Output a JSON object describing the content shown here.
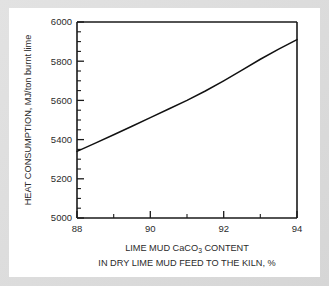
{
  "figure": {
    "background_color": "#ffffff",
    "frame_color": "#d9d9d9",
    "axis_color": "#1a1a1a",
    "curve_color": "#111111"
  },
  "chart_data": {
    "type": "line",
    "title": "",
    "xlabel_line1": "LIME MUD CaCO",
    "xlabel_line1_sub": "3",
    "xlabel_line1_tail": " CONTENT",
    "xlabel_line2": "IN DRY LIME MUD FEED TO THE KILN, %",
    "ylabel": "HEAT CONSUMPTION, MJ/ton burnt lime",
    "xlim": [
      88,
      94
    ],
    "ylim": [
      5000,
      6000
    ],
    "x_major_ticks": [
      88,
      90,
      92,
      94
    ],
    "x_major_tick_labels": [
      "88",
      "90",
      "92",
      "94"
    ],
    "x_minor_ticks": [
      89,
      91,
      93
    ],
    "y_major_ticks": [
      5000,
      5200,
      5400,
      5600,
      5800,
      6000
    ],
    "y_major_tick_labels": [
      "5000",
      "5200",
      "5400",
      "5600",
      "5800",
      "6000"
    ],
    "y_minor_ticks": [
      5050,
      5100,
      5150,
      5250,
      5300,
      5350,
      5450,
      5500,
      5550,
      5650,
      5700,
      5750,
      5850,
      5900,
      5950
    ],
    "grid": false,
    "legend": null,
    "series": [
      {
        "name": "heat consumption",
        "x": [
          88,
          88.5,
          89,
          89.5,
          90,
          90.5,
          91,
          91.5,
          92,
          92.5,
          93,
          93.5,
          94
        ],
        "values": [
          5340,
          5382,
          5425,
          5468,
          5512,
          5556,
          5600,
          5648,
          5700,
          5754,
          5810,
          5862,
          5910
        ]
      }
    ]
  }
}
